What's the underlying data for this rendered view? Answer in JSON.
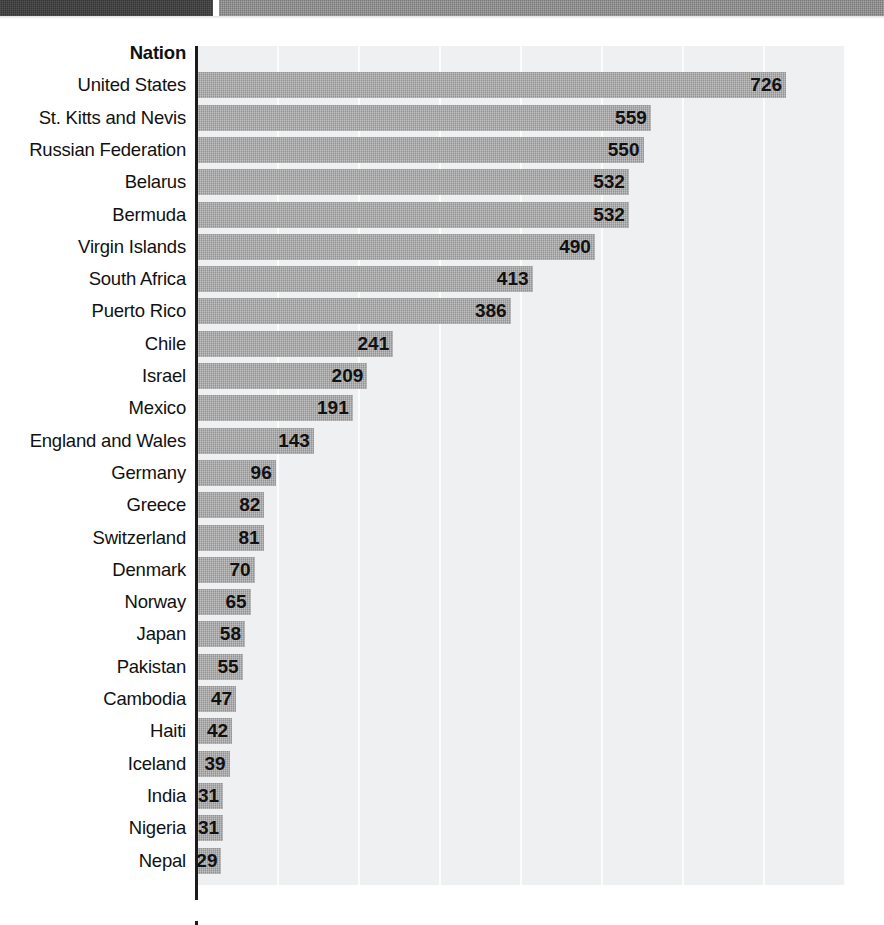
{
  "banner": {
    "left_strip_color": "#3c3c3c",
    "right_strip_color": "#8f8f8f"
  },
  "chart_data": {
    "type": "bar",
    "orientation": "horizontal",
    "title": "",
    "xlabel": "",
    "ylabel": "Nation",
    "header_label": "Nation",
    "xlim": [
      0,
      800
    ],
    "gridlines": [
      0,
      100,
      200,
      300,
      400,
      500,
      600,
      700,
      800
    ],
    "grid": true,
    "legend": "none",
    "bar_color": "#a9a9a9",
    "plot_background": "#eef0f1",
    "axis_color": "#1b1b1b",
    "categories": [
      "United States",
      "St. Kitts and Nevis",
      "Russian Federation",
      "Belarus",
      "Bermuda",
      "Virgin Islands",
      "South Africa",
      "Puerto Rico",
      "Chile",
      "Israel",
      "Mexico",
      "England and Wales",
      "Germany",
      "Greece",
      "Switzerland",
      "Denmark",
      "Norway",
      "Japan",
      "Pakistan",
      "Cambodia",
      "Haiti",
      "Iceland",
      "India",
      "Nigeria",
      "Nepal"
    ],
    "values": [
      726,
      559,
      550,
      532,
      532,
      490,
      413,
      386,
      241,
      209,
      191,
      143,
      96,
      82,
      81,
      70,
      65,
      58,
      55,
      47,
      42,
      39,
      31,
      31,
      29
    ]
  }
}
